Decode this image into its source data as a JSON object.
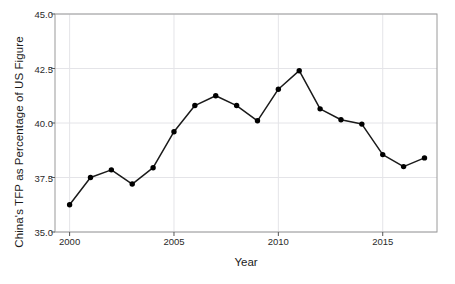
{
  "chart_data": {
    "type": "line",
    "title": "",
    "xlabel": "Year",
    "ylabel": "China's TFP as Percentage of US Figure",
    "x": [
      2000,
      2001,
      2002,
      2003,
      2004,
      2005,
      2006,
      2007,
      2008,
      2009,
      2010,
      2011,
      2012,
      2013,
      2014,
      2015,
      2016,
      2017
    ],
    "values": [
      36.25,
      37.5,
      37.85,
      37.2,
      37.95,
      39.6,
      40.8,
      41.25,
      40.8,
      40.1,
      41.55,
      42.4,
      40.65,
      40.15,
      39.95,
      38.55,
      38.0,
      38.4
    ],
    "series": [
      {
        "name": "China's TFP as Percentage of US Figure",
        "values": [
          36.25,
          37.5,
          37.85,
          37.2,
          37.95,
          39.6,
          40.8,
          41.25,
          40.8,
          40.1,
          41.55,
          42.4,
          40.65,
          40.15,
          39.95,
          38.55,
          38.0,
          38.4
        ]
      }
    ],
    "xlim": [
      1999.3,
      2017.6
    ],
    "ylim": [
      35.0,
      45.0
    ],
    "xticks": [
      2000,
      2005,
      2010,
      2015
    ],
    "xtick_labels": [
      "2000",
      "2005",
      "2010",
      "2015"
    ],
    "yticks": [
      35.0,
      37.5,
      40.0,
      42.5,
      45.0
    ],
    "ytick_labels": [
      "35.0",
      "37.5",
      "40.0",
      "42.5",
      "45.0"
    ],
    "grid": true,
    "legend": null,
    "marker": "circle",
    "line_color": "#1a1a1a",
    "marker_color": "#000000",
    "grid_color": "#e4e4e8",
    "frame_color": "#9a9a9a",
    "background_color": "#ffffff"
  }
}
